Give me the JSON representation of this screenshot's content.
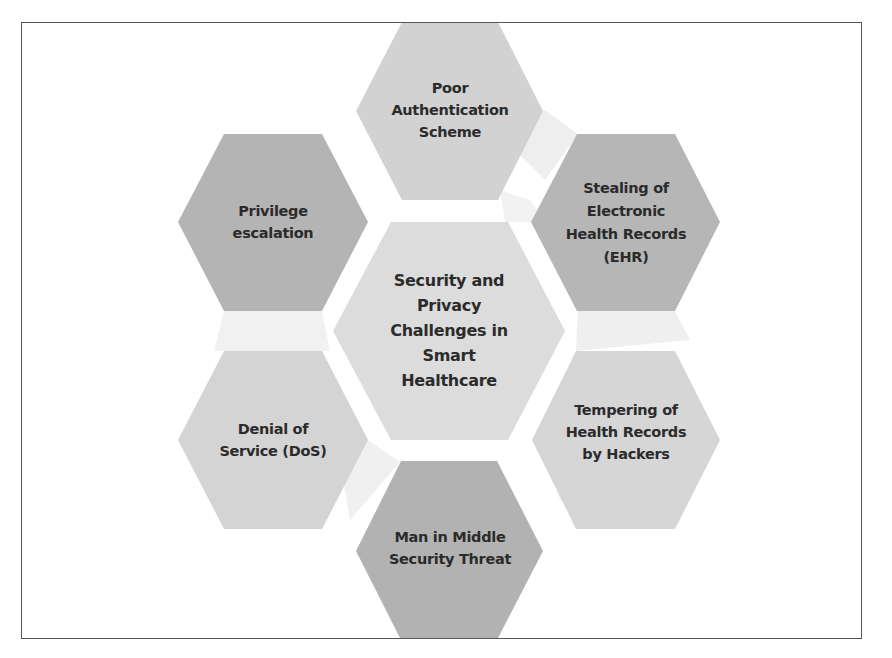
{
  "diagram": {
    "type": "hexagon-cluster",
    "colors": {
      "frame_border": "#555555",
      "background": "#ffffff",
      "connector_fill": "#eeeeee",
      "text": "#2b2b2b"
    },
    "center": {
      "label": "Security and\nPrivacy\nChallenges in\nSmart\nHealthcare",
      "fill": "#dcdcdc"
    },
    "nodes": [
      {
        "id": "top",
        "label": "Poor\nAuthentication\nScheme",
        "fill": "#d2d2d2"
      },
      {
        "id": "upper-right",
        "label": "Stealing of\nElectronic\nHealth Records\n(EHR)",
        "fill": "#b6b6b6"
      },
      {
        "id": "lower-right",
        "label": "Tempering of\nHealth Records\nby Hackers",
        "fill": "#d6d6d6"
      },
      {
        "id": "bottom",
        "label": "Man in Middle\nSecurity Threat",
        "fill": "#b2b2b2"
      },
      {
        "id": "lower-left",
        "label": "Denial of\nService (DoS)",
        "fill": "#d4d4d4"
      },
      {
        "id": "upper-left",
        "label": "Privilege\nescalation",
        "fill": "#b4b4b4"
      }
    ]
  }
}
